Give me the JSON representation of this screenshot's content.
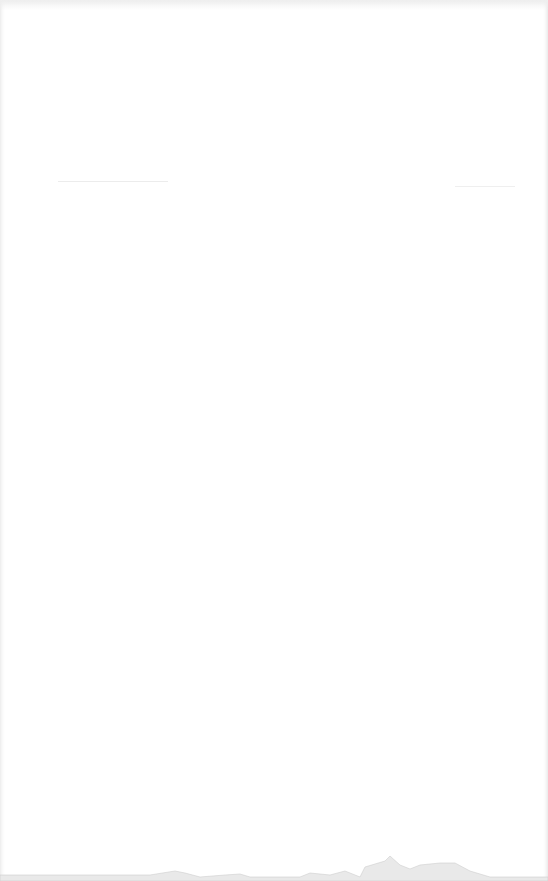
{
  "page": {
    "type": "blank-scanned-page",
    "text": "",
    "colors": {
      "paper": "#ffffff",
      "edge_shadow": "#e4e4e4",
      "stain": "#d8d8d8"
    }
  }
}
